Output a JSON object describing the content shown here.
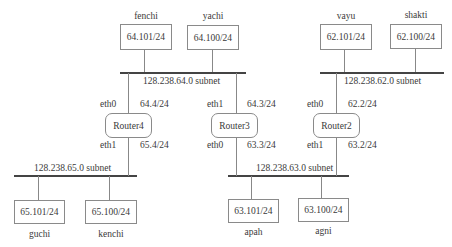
{
  "diagram": {
    "type": "network-topology",
    "subnets": [
      {
        "id": "s64",
        "label": "128.238.64.0 subnet"
      },
      {
        "id": "s62",
        "label": "128.238.62.0 subnet"
      },
      {
        "id": "s65",
        "label": "128.238.65.0 subnet"
      },
      {
        "id": "s63",
        "label": "128.238.63.0 subnet"
      }
    ],
    "hosts": [
      {
        "name": "fenchi",
        "ip": "64.101/24",
        "subnet": "s64"
      },
      {
        "name": "yachi",
        "ip": "64.100/24",
        "subnet": "s64"
      },
      {
        "name": "vayu",
        "ip": "62.101/24",
        "subnet": "s62"
      },
      {
        "name": "shakti",
        "ip": "62.100/24",
        "subnet": "s62"
      },
      {
        "name": "guchi",
        "ip": "65.101/24",
        "subnet": "s65"
      },
      {
        "name": "kenchi",
        "ip": "65.100/24",
        "subnet": "s65"
      },
      {
        "name": "apah",
        "ip": "63.101/24",
        "subnet": "s63"
      },
      {
        "name": "agni",
        "ip": "63.100/24",
        "subnet": "s63"
      }
    ],
    "routers": [
      {
        "name": "Router4",
        "top_iface": "eth0",
        "top_ip": "64.4/24",
        "bottom_iface": "eth1",
        "bottom_ip": "65.4/24"
      },
      {
        "name": "Router3",
        "top_iface": "eth1",
        "top_ip": "64.3/24",
        "bottom_iface": "eth0",
        "bottom_ip": "63.3/24"
      },
      {
        "name": "Router2",
        "top_iface": "eth0",
        "top_ip": "62.2/24",
        "bottom_iface": "eth1",
        "bottom_ip": "63.2/24"
      }
    ]
  }
}
